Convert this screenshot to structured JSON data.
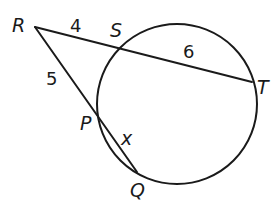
{
  "diagram": {
    "type": "secant-secant theorem",
    "circle": {
      "cx": 177,
      "cy": 104,
      "r": 80
    },
    "points": {
      "R": {
        "label": "R",
        "x": 35,
        "y": 27,
        "label_x": 12,
        "label_y": 32
      },
      "S": {
        "label": "S",
        "x": 121,
        "y": 48,
        "label_x": 110,
        "label_y": 37
      },
      "T": {
        "label": "T",
        "x": 252,
        "y": 82,
        "label_x": 257,
        "label_y": 94
      },
      "P": {
        "label": "P",
        "x": 98,
        "y": 120,
        "label_x": 80,
        "label_y": 130
      },
      "Q": {
        "label": "Q",
        "x": 137,
        "y": 172,
        "label_x": 130,
        "label_y": 197
      }
    },
    "segments": [
      {
        "from": "R",
        "to": "T",
        "name": "secant-RT"
      },
      {
        "from": "R",
        "to": "Q",
        "name": "secant-RQ"
      }
    ],
    "lengths": {
      "RS": {
        "text": "4",
        "x": 70,
        "y": 32
      },
      "ST": {
        "text": "6",
        "x": 183,
        "y": 58
      },
      "RP": {
        "text": "5",
        "x": 46,
        "y": 85
      },
      "PQ": {
        "text": "x",
        "x": 121,
        "y": 145
      }
    }
  }
}
